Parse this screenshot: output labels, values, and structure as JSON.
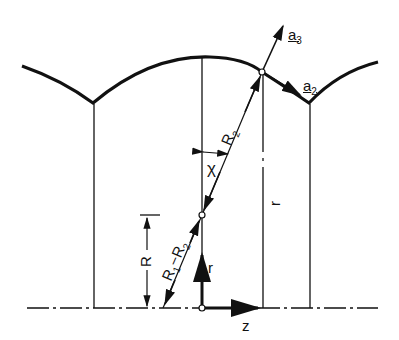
{
  "labels": {
    "a3": "a",
    "a3_sub": "3",
    "a2": "a",
    "a2_sub": "2",
    "R2": "R",
    "R2_sub": "2",
    "chi": "χ",
    "r_long": "r",
    "R": "R",
    "R1R2": "R",
    "R1R2_sub1": "1",
    "R1R2_mid": "−R",
    "R1R2_sub2": "2",
    "r_axis": "r",
    "z_axis": "z"
  }
}
